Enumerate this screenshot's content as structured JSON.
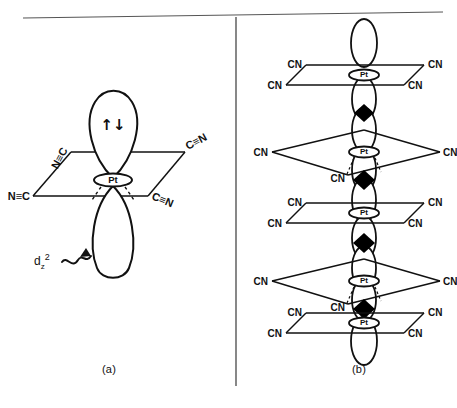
{
  "figure": {
    "rule_top": "horizontal-rule",
    "divider": "vertical-divider"
  },
  "captions": {
    "panel_a": "(a)",
    "panel_b": "(b)"
  },
  "panel_a": {
    "metal_label": "Pt",
    "orbital_label_base": "d",
    "orbital_label_sub": "z",
    "orbital_label_sup": "2",
    "electron_pair": "↑↓",
    "ligands": [
      {
        "id": "upper-left",
        "text": "N≡C"
      },
      {
        "id": "upper-right",
        "text": "C≡N"
      },
      {
        "id": "lower-left",
        "text": "N≡C"
      },
      {
        "id": "lower-right",
        "text": "C≡N"
      }
    ]
  },
  "panel_b": {
    "metal_label": "Pt",
    "ligand_label": "CN",
    "unit_count": 5,
    "contact_count": 4,
    "units": [
      {
        "index": 1,
        "plane": "narrow",
        "ligands": [
          "CN",
          "CN",
          "CN",
          "CN"
        ]
      },
      {
        "index": 2,
        "plane": "wide",
        "ligands": [
          "CN",
          "CN",
          "CN"
        ]
      },
      {
        "index": 3,
        "plane": "narrow",
        "ligands": [
          "CN",
          "CN",
          "CN",
          "CN"
        ]
      },
      {
        "index": 4,
        "plane": "wide",
        "ligands": [
          "CN",
          "CN",
          "CN"
        ]
      },
      {
        "index": 5,
        "plane": "narrow",
        "ligands": [
          "CN",
          "CN",
          "CN",
          "CN"
        ]
      }
    ]
  },
  "colors": {
    "ink": "#111111",
    "rule": "#555555",
    "fill": "#ffffff",
    "contact": "#000000"
  }
}
